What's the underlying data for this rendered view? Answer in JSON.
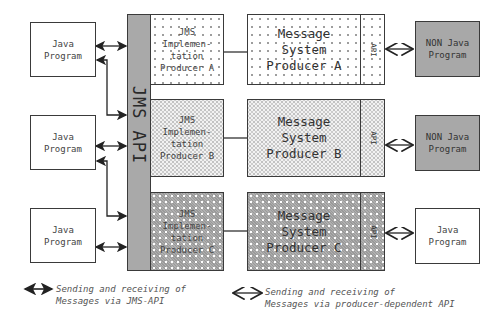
{
  "diagram": {
    "jms_api_label": "JMS API",
    "left_programs": [
      {
        "label": "Java\nProgram"
      },
      {
        "label": "Java\nProgram"
      },
      {
        "label": "Java\nProgram"
      }
    ],
    "implementations": [
      {
        "label": "JMS\nImplemen-\ntation\nProducer A"
      },
      {
        "label": "JMS\nImplemen-\ntation\nProducer B"
      },
      {
        "label": "JMS\nImplemen-\ntation\nProducer C"
      }
    ],
    "message_systems": [
      {
        "label": "Message\nSystem\nProducer A",
        "api_label": "API"
      },
      {
        "label": "Message\nSystem\nProducer B",
        "api_label": "API"
      },
      {
        "label": "Message\nSystem\nProducer C",
        "api_label": "API"
      }
    ],
    "right_programs": [
      {
        "label": "NON Java\nProgram"
      },
      {
        "label": "NON Java\nProgram"
      },
      {
        "label": "Java\nProgram"
      }
    ]
  },
  "legend": {
    "jms_arrow_text": "Sending and receiving of\nMessages via JMS-API",
    "producer_arrow_text": "Sending and receiving of\nMessages via producer-dependent API"
  },
  "colors": {
    "border": "#3a3a3a",
    "jms_bar": "#a9a9a9",
    "non_java_fill": "#a8a8a8"
  }
}
